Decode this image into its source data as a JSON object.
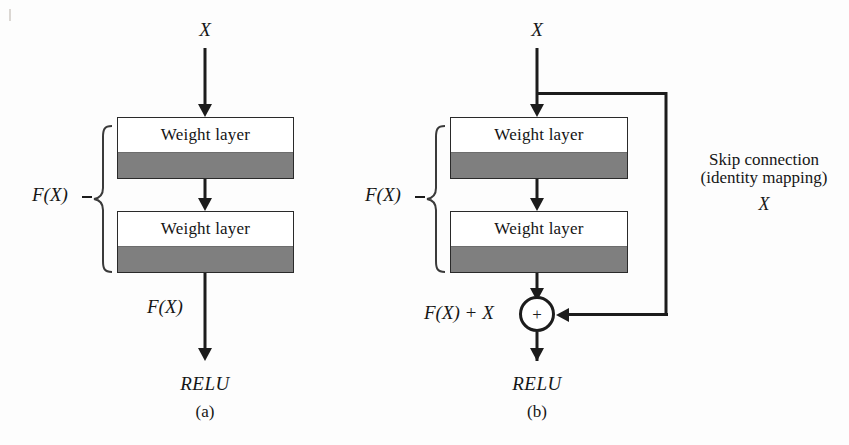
{
  "figure": {
    "background_color": "#fdfdfd",
    "line_color": "#1c1c1c",
    "band_color": "#7f7f7f",
    "box_fill": "#ffffff"
  },
  "panel_a": {
    "caption": "(a)",
    "input_label": "X",
    "bracket_label": "F(X)",
    "output_label": "F(X)",
    "activation_label": "RELU",
    "blocks": [
      {
        "label": "Weight layer"
      },
      {
        "label": "Weight layer"
      }
    ]
  },
  "panel_b": {
    "caption": "(b)",
    "input_label": "X",
    "bracket_label": "F(X)",
    "sum_symbol": "+",
    "sum_label": "F(X) + X",
    "activation_label": "RELU",
    "skip_line1": "Skip connection",
    "skip_line2": "(identity mapping)",
    "skip_line3": "X",
    "blocks": [
      {
        "label": "Weight layer"
      },
      {
        "label": "Weight layer"
      }
    ]
  }
}
